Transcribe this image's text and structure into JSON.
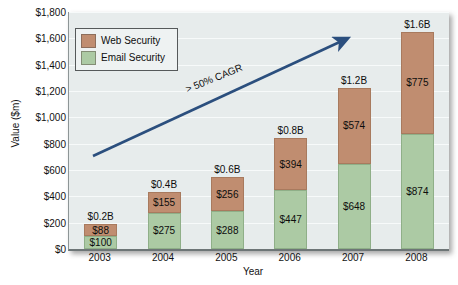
{
  "chart_data": {
    "type": "bar",
    "subtype": "stacked-bar",
    "title": "",
    "xlabel": "Year",
    "ylabel": "Value ($m)",
    "categories": [
      "2003",
      "2004",
      "2005",
      "2006",
      "2007",
      "2008"
    ],
    "series": [
      {
        "name": "Email Security",
        "color": "#accaa4",
        "values": [
          100,
          275,
          288,
          447,
          648,
          874
        ],
        "labels": [
          "$100",
          "$275",
          "$288",
          "$447",
          "$648",
          "$874"
        ]
      },
      {
        "name": "Web Security",
        "color": "#c08d70",
        "values": [
          88,
          155,
          256,
          394,
          574,
          775
        ],
        "labels": [
          "$88",
          "$155",
          "$256",
          "$394",
          "$574",
          "$775"
        ]
      }
    ],
    "totals": [
      188,
      430,
      544,
      841,
      1222,
      1649
    ],
    "total_labels": [
      "$0.2B",
      "$0.4B",
      "$0.6B",
      "$0.8B",
      "$1.2B",
      "$1.6B"
    ],
    "ylim": [
      0,
      1800
    ],
    "ytick_values": [
      0,
      200,
      400,
      600,
      800,
      1000,
      1200,
      1400,
      1600,
      1800
    ],
    "ytick_labels": [
      "$0",
      "$200",
      "$400",
      "$600",
      "$800",
      "$1,000",
      "$1,200",
      "$1,400",
      "$1,600",
      "$1,800"
    ],
    "grid": true,
    "legend_position": "top-left",
    "annotations": [
      {
        "text": "> 50% CAGR",
        "type": "arrow",
        "color": "#2b4f7e"
      }
    ],
    "plot_background": "#e7ecec"
  },
  "legend": {
    "items": [
      {
        "label": "Web Security",
        "color": "#c08d70"
      },
      {
        "label": "Email Security",
        "color": "#accaa4"
      }
    ]
  },
  "axes": {
    "y_title": "Value ($m)",
    "x_title": "Year"
  },
  "annotation": {
    "cagr": "> 50% CAGR"
  }
}
